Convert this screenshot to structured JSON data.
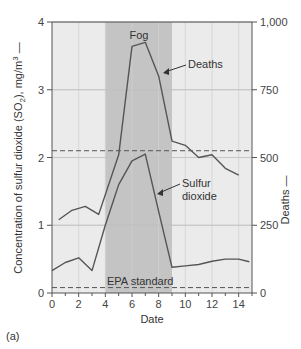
{
  "chart_data": {
    "type": "line",
    "title": "",
    "xlabel": "Date",
    "ylabel_left": "Concentration of sulfur dioxide (SO2), mg/m3",
    "ylabel_right": "Deaths",
    "panel_label": "(a)",
    "xlim": [
      0,
      15
    ],
    "ylim_left": [
      0,
      4
    ],
    "ylim_right": [
      0,
      1000
    ],
    "x_ticks": [
      0,
      2,
      4,
      6,
      8,
      10,
      12,
      14
    ],
    "y_left_ticks": [
      0,
      1,
      2,
      3,
      4
    ],
    "y_right_ticks": [
      "0",
      "250",
      "500",
      "750",
      "1,000"
    ],
    "grid": true,
    "shaded_region": {
      "label": "Fog",
      "x_start": 4,
      "x_end": 9
    },
    "reference_lines": [
      {
        "label": "EPA standard",
        "axis": "left",
        "value": 0.08
      },
      {
        "label": "",
        "axis": "left",
        "value": 2.1
      }
    ],
    "series": [
      {
        "name": "Deaths",
        "axis": "right",
        "x": [
          0.5,
          1.5,
          2.5,
          3.5,
          5,
          6,
          7,
          8,
          9,
          10,
          11,
          12,
          13,
          14
        ],
        "values": [
          270,
          305,
          320,
          290,
          510,
          910,
          925,
          800,
          560,
          545,
          500,
          510,
          460,
          435
        ]
      },
      {
        "name": "Sulfur dioxide",
        "axis": "left",
        "x": [
          0,
          1,
          2,
          3,
          4,
          5,
          6,
          7,
          8,
          9,
          10,
          11,
          12,
          13,
          14,
          14.8
        ],
        "values": [
          0.33,
          0.45,
          0.52,
          0.33,
          1.0,
          1.6,
          1.95,
          2.05,
          1.2,
          0.38,
          0.4,
          0.42,
          0.47,
          0.5,
          0.5,
          0.46
        ]
      }
    ],
    "annotations": [
      "Fog",
      "Deaths",
      "Sulfur dioxide",
      "EPA standard"
    ]
  },
  "labels": {
    "fog": "Fog",
    "deaths": "Deaths",
    "sulfur_line1": "Sulfur",
    "sulfur_line2": "dioxide",
    "epa": "EPA standard",
    "xlabel": "Date",
    "ylabel_left": "Concentration of sulfur dioxide (SO",
    "ylabel_left_sub": "2",
    "ylabel_left_tail": "), mg/m",
    "ylabel_left_sup": "3",
    "ylabel_right": "Deaths",
    "panel": "(a)"
  },
  "colors": {
    "plot_bg": "#ebebeb",
    "fog_band": "#c4c4c4",
    "line": "#555555",
    "grid": "#d0d0d0",
    "axis": "#555555"
  }
}
